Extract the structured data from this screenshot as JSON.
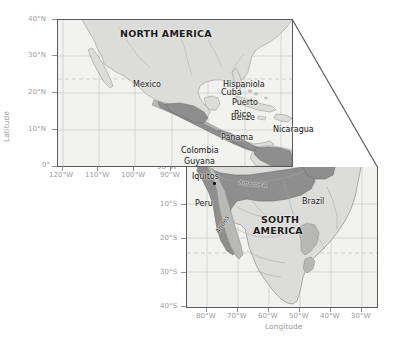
{
  "figure": {
    "type": "map"
  },
  "axes": {
    "north_panel": {
      "latitude_ticks": [
        "40°N",
        "30°N",
        "20°N",
        "10°N",
        "0°"
      ],
      "longitude_ticks": [
        "120°W",
        "110°W",
        "100°W",
        "90°W"
      ],
      "lat_range": [
        0,
        40
      ],
      "lon_range": [
        -125,
        -85
      ]
    },
    "south_panel": {
      "latitude_ticks": [
        "10°S",
        "20°S",
        "30°S",
        "40°S"
      ],
      "longitude_ticks": [
        "80°W",
        "70°W",
        "60°W",
        "50°W",
        "40°W",
        "30°W"
      ],
      "lat_range": [
        -40,
        2
      ],
      "lon_range": [
        -85,
        -30
      ]
    },
    "y_title": "Latitude",
    "x_title": "Longitude"
  },
  "labels": {
    "continent_north": "NORTH AMERICA",
    "continent_south_line1": "SOUTH",
    "continent_south_line2": "AMERICA",
    "places": [
      {
        "name": "Mexico"
      },
      {
        "name": "Cuba"
      },
      {
        "name": "Hispaniola"
      },
      {
        "name": "Belize"
      },
      {
        "name": "Puerto"
      },
      {
        "name": "Rico"
      },
      {
        "name": "Nicaragua"
      },
      {
        "name": "Panama"
      },
      {
        "name": "Colombia"
      },
      {
        "name": "Guyana"
      },
      {
        "name": "Iquitos"
      },
      {
        "name": "Peru"
      },
      {
        "name": "Brazil"
      },
      {
        "name": "Andes"
      },
      {
        "name": "Amazon R."
      }
    ]
  },
  "colors": {
    "ocean": "#f2f2f0",
    "land": "#dcdcda",
    "range_dark": "#8e8e8e",
    "range_mid": "#b8b8b6",
    "border": "#5a5a5a",
    "graticule": "#c2c2c2",
    "axis_text": "#9b9b9b",
    "place_text": "#1b1b1b"
  }
}
